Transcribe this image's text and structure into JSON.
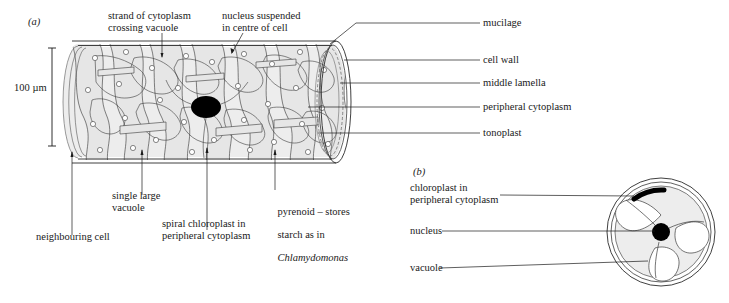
{
  "figure": {
    "title_a": "(a)",
    "title_b": "(b)",
    "scale_bar": "100 µm",
    "background_color": "#ffffff",
    "ink_color": "#1a1a1a",
    "cytoplasm_fill": "#e9e9e9",
    "nucleus_color": "#000000"
  },
  "labels_a": {
    "strand": "strand of cytoplasm\ncrossing vacuole",
    "nucleus_suspended": "nucleus suspended\nin centre of cell",
    "mucilage": "mucilage",
    "cell_wall": "cell wall",
    "middle_lamella": "middle lamella",
    "peripheral_cytoplasm": "peripheral cytoplasm",
    "tonoplast": "tonoplast",
    "neighbouring_cell": "neighbouring cell",
    "single_large_vacuole": "single large\nvacuole",
    "spiral_chloroplast": "spiral chloroplast in\nperipheral cytoplasm",
    "pyrenoid_line1": "pyrenoid – stores",
    "pyrenoid_line2": "starch as in",
    "pyrenoid_line3": "Chlamydomonas"
  },
  "labels_b": {
    "chloroplast": "chloroplast in\nperipheral cytoplasm",
    "nucleus": "nucleus",
    "vacuole": "vacuole"
  }
}
